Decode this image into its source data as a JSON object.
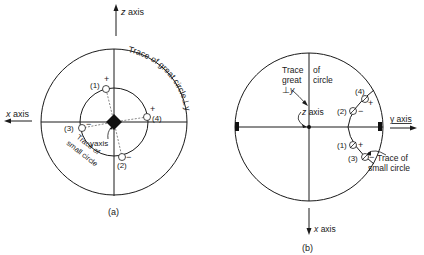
{
  "figure_a": {
    "caption": "(a)",
    "x_axis_label": "x axis",
    "x_axis_var": "x",
    "x_axis_word": "axis",
    "z_axis_var": "z",
    "z_axis_word": "axis",
    "y_axis_label": "yaxis",
    "great_circle_label": "Trace of great circle⊥y",
    "small_circle_label_line1": "Trace of",
    "small_circle_label_line2": "small circle",
    "points": [
      {
        "id": "(1)",
        "sign": "+"
      },
      {
        "id": "(2)",
        "sign": "−"
      },
      {
        "id": "(3)",
        "sign": "−"
      },
      {
        "id": "(4)",
        "sign": "+"
      }
    ]
  },
  "figure_b": {
    "caption": "(b)",
    "x_axis_var": "x",
    "x_axis_word": "axis",
    "y_axis_label": "y axis",
    "z_axis_var": "z",
    "z_axis_word": "axis",
    "great_circle_line1": "Trace",
    "great_circle_line1b": "of",
    "great_circle_line2": "great",
    "great_circle_line2b": "circle",
    "great_circle_line3": "⊥",
    "great_circle_line3b": "y",
    "small_circle_label_line1": "Trace of",
    "small_circle_label_line2": "small circle",
    "points": [
      {
        "id": "(1)",
        "sign": "+"
      },
      {
        "id": "(2)",
        "sign": "−"
      },
      {
        "id": "(3)",
        "sign": "−"
      },
      {
        "id": "(4)",
        "sign": "+"
      }
    ]
  },
  "colors": {
    "ink": "#1a1a1a",
    "background": "#ffffff"
  }
}
